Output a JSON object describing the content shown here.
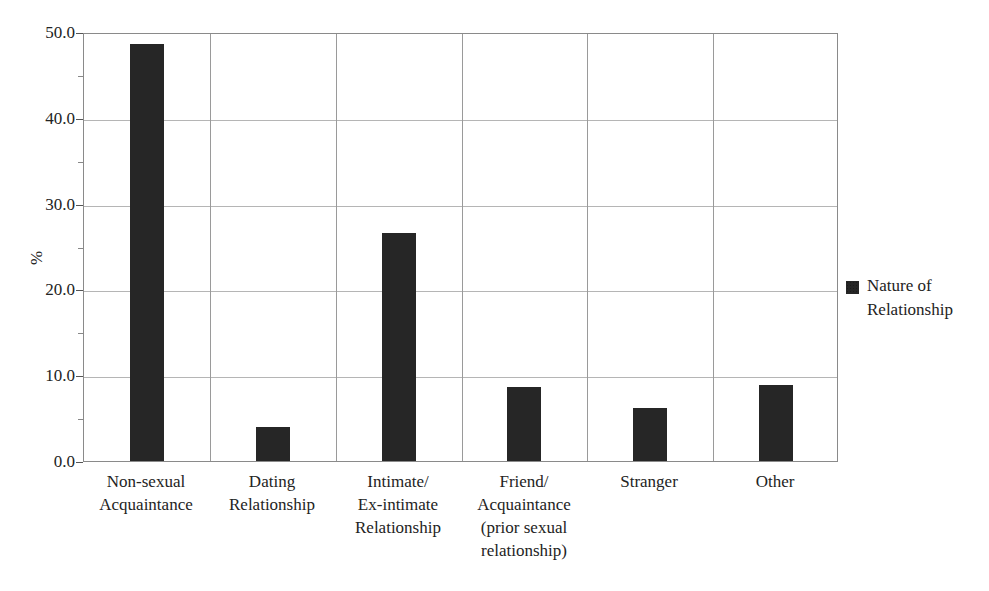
{
  "figure": {
    "caption_remnant": "",
    "background_color": "#ffffff",
    "bar_color": "#262626",
    "frame_color": "#8a8a8a",
    "grid_color": "#b5b5b5"
  },
  "legend": {
    "title": "Nature of\nRelationship",
    "swatch_name": "legend-color-swatch"
  },
  "chart_data": {
    "type": "bar",
    "title": "",
    "xlabel": "",
    "ylabel": "%",
    "ylim": [
      0.0,
      50.0
    ],
    "ytick_step": 10.0,
    "yminor_step": 5.0,
    "grid": true,
    "legend_position": "right",
    "ytick_labels": [
      "0.0",
      "10.0",
      "20.0",
      "30.0",
      "40.0",
      "50.0"
    ],
    "ytick_values": [
      0.0,
      10.0,
      20.0,
      30.0,
      40.0,
      50.0
    ],
    "yminor_values": [
      5.0,
      15.0,
      25.0,
      35.0,
      45.0
    ],
    "categories": [
      "Non-sexual\nAcquaintance",
      "Dating\nRelationship",
      "Intimate/\nEx-intimate\nRelationship",
      "Friend/\nAcquaintance\n(prior sexual\nrelationship)",
      "Stranger",
      "Other"
    ],
    "series": [
      {
        "name": "Nature of Relationship",
        "color": "#262626",
        "values": [
          48.6,
          4.0,
          26.6,
          8.6,
          6.2,
          8.9
        ]
      }
    ]
  }
}
